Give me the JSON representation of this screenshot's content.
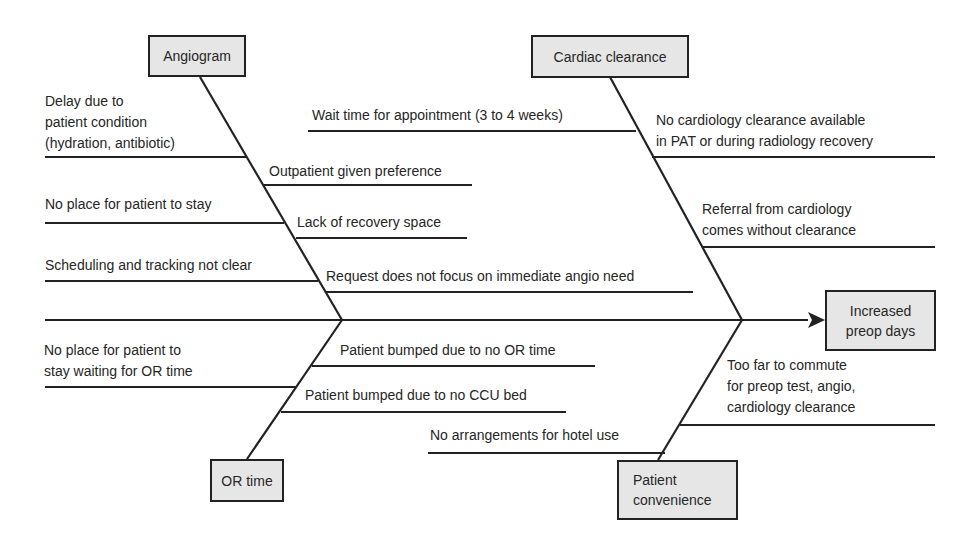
{
  "diagram": {
    "type": "fishbone",
    "effect": {
      "label_line1": "Increased",
      "label_line2": "preop days"
    },
    "categories": {
      "angiogram": {
        "label": "Angiogram",
        "causes_left": [
          {
            "line1": "Delay due to",
            "line2": "patient condition",
            "line3": "(hydration, antibiotic)"
          },
          {
            "line1": "No place for patient to stay"
          },
          {
            "line1": "Scheduling and tracking not clear"
          }
        ],
        "causes_right": [
          {
            "line1": "Outpatient given preference"
          },
          {
            "line1": "Lack of recovery space"
          },
          {
            "line1": "Request does not focus on immediate angio need"
          }
        ]
      },
      "cardiac_clearance": {
        "label": "Cardiac clearance",
        "causes_left": [
          {
            "line1": "Wait time for appointment (3 to 4 weeks)"
          }
        ],
        "causes_right": [
          {
            "line1": "No cardiology clearance available",
            "line2": "in PAT or during radiology recovery"
          },
          {
            "line1": "Referral from cardiology",
            "line2": "comes without clearance"
          }
        ]
      },
      "or_time": {
        "label": "OR time",
        "causes_left": [
          {
            "line1": "No place for patient to",
            "line2": "stay waiting for OR time"
          }
        ],
        "causes_right": [
          {
            "line1": "Patient bumped due to no OR time"
          },
          {
            "line1": "Patient bumped due to no CCU bed"
          }
        ]
      },
      "patient_convenience": {
        "label_line1": "Patient",
        "label_line2": "convenience",
        "causes_left": [
          {
            "line1": "No arrangements for hotel use"
          }
        ],
        "causes_right": [
          {
            "line1": "Too far to commute",
            "line2": "for preop test, angio,",
            "line3": "cardiology clearance"
          }
        ]
      }
    },
    "colors": {
      "line": "#222222",
      "box_fill": "#e6e6e6",
      "text": "#262626"
    }
  }
}
